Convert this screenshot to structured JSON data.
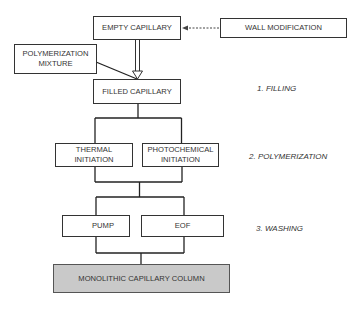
{
  "diagram": {
    "type": "flowchart",
    "nodes": {
      "empty_capillary": "EMPTY CAPILLARY",
      "wall_modification": "WALL MODIFICATION",
      "polymerization_mixture_line1": "POLYMERIZATION",
      "polymerization_mixture_line2": "MIXTURE",
      "filled_capillary": "FILLED CAPILLARY",
      "thermal_line1": "THERMAL",
      "thermal_line2": "INITIATION",
      "photochemical_line1": "PHOTOCHEMICAL",
      "photochemical_line2": "INITIATION",
      "pump": "PUMP",
      "eof": "EOF",
      "monolithic_column": "MONOLITHIC CAPILLARY COLUMN"
    },
    "steps": [
      {
        "label": "1. FILLING"
      },
      {
        "label": "2. POLYMERIZATION"
      },
      {
        "label": "3. WASHING"
      }
    ],
    "edges": [
      {
        "from": "wall_modification",
        "to": "empty_capillary",
        "style": "dashed-arrow"
      },
      {
        "from": "empty_capillary",
        "to": "filled_capillary",
        "style": "double-line-arrow"
      },
      {
        "from": "polymerization_mixture",
        "to": "filled_capillary",
        "style": "line"
      },
      {
        "from": "filled_capillary",
        "to": "thermal_initiation",
        "style": "branch"
      },
      {
        "from": "filled_capillary",
        "to": "photochemical_initiation",
        "style": "branch"
      },
      {
        "from": "polymerization",
        "to": "pump",
        "style": "branch"
      },
      {
        "from": "polymerization",
        "to": "eof",
        "style": "branch"
      },
      {
        "from": "washing",
        "to": "monolithic_column",
        "style": "merge"
      }
    ],
    "colors": {
      "line": "#333333",
      "final_box_fill": "#c9c9c9"
    }
  }
}
